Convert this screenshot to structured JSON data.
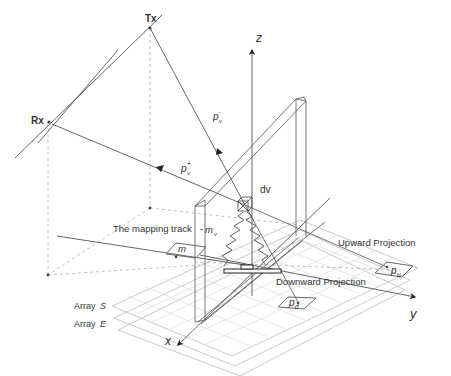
{
  "labels": {
    "tx": "Tx",
    "rx": "Rx",
    "z_axis": "z",
    "y_axis": "y",
    "x_axis": "x",
    "dv": "dv",
    "p_v_minus": "p",
    "p_v_minus_sub": "v",
    "p_v_minus_sup": "-",
    "p_v_plus": "p",
    "p_v_plus_sub": "v",
    "p_v_plus_sup": "+",
    "mapping_track": "The mapping track",
    "m_v": "m",
    "m_v_sub": "v",
    "m": "m",
    "upward_projection": "Upward Projection",
    "downward_projection": "Downward Projection",
    "p_u": "p",
    "p_u_sub": "u",
    "p_d": "p",
    "p_d_sub": "d",
    "array_s_prefix": "Array ",
    "array_s": "S",
    "array_e_prefix": "Array ",
    "array_e": "E"
  },
  "colors": {
    "line": "#555555",
    "grid": "#cfcfcf",
    "dashed": "#b0b0b0",
    "text": "#333333"
  }
}
